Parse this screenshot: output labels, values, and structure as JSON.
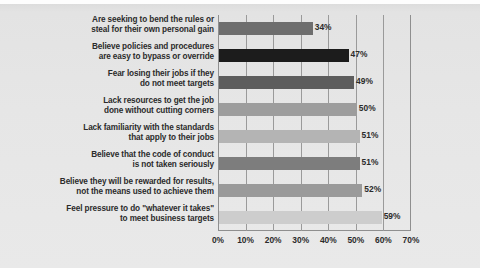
{
  "page": {
    "background_color": "#e6e6e6",
    "plot_frame_color": "#8f8f8f",
    "gridline_color": "#9a9a9a",
    "text_color": "#2b2b2b"
  },
  "chart_data": {
    "type": "bar",
    "orientation": "horizontal",
    "title": "",
    "subtitle": "",
    "xlabel": "",
    "ylabel": "",
    "xlim": [
      0,
      70
    ],
    "grid": true,
    "legend": "none",
    "tick_labels": [
      "0%",
      "10%",
      "20%",
      "30%",
      "40%",
      "50%",
      "60%",
      "70%"
    ],
    "tick_values": [
      0,
      10,
      20,
      30,
      40,
      50,
      60,
      70
    ],
    "categories": [
      "Are seeking to bend the rules or steal for their own personal gain",
      "Believe policies and procedures are easy to bypass or override",
      "Fear losing their jobs if they do not meet targets",
      "Lack resources to get the job done without cutting corners",
      "Lack familiarity with the standards that apply to their jobs",
      "Believe that the code of conduct is not taken seriously",
      "Believe they will be rewarded for results, not the means used to achieve them",
      "Feel pressure to do \"whatever it takes\" to meet business targets"
    ],
    "values": [
      34,
      47,
      49,
      50,
      51,
      51,
      52,
      59
    ],
    "value_labels": [
      "34%",
      "47%",
      "49%",
      "50%",
      "51%",
      "51%",
      "52%",
      "59%"
    ],
    "bar_colors": [
      "#6e6e6e",
      "#1c1c1c",
      "#5d5d5d",
      "#9d9d9d",
      "#b4b4b4",
      "#7d7d7d",
      "#9a9a9a",
      "#cdcdcd"
    ]
  },
  "rows": [
    {
      "line1": "Are seeking to bend the rules or",
      "line2": "steal for their own personal gain",
      "value_label": "34%"
    },
    {
      "line1": "Believe policies and procedures",
      "line2": "are easy to bypass or override",
      "value_label": "47%"
    },
    {
      "line1": "Fear losing their jobs if they",
      "line2": "do not meet targets",
      "value_label": "49%"
    },
    {
      "line1": "Lack resources to get the job",
      "line2": "done without cutting corners",
      "value_label": "50%"
    },
    {
      "line1": "Lack familiarity with the standards",
      "line2": "that apply to their jobs",
      "value_label": "51%"
    },
    {
      "line1": "Believe that the code of conduct",
      "line2": "is not taken seriously",
      "value_label": "51%"
    },
    {
      "line1": "Believe they will be rewarded for results,",
      "line2": "not the means used to achieve them",
      "value_label": "52%"
    },
    {
      "line1": "Feel pressure to do \"whatever it takes\"",
      "line2": "to meet business targets",
      "value_label": "59%"
    }
  ],
  "axis": {
    "ticks": [
      "0%",
      "10%",
      "20%",
      "30%",
      "40%",
      "50%",
      "60%",
      "70%"
    ]
  }
}
